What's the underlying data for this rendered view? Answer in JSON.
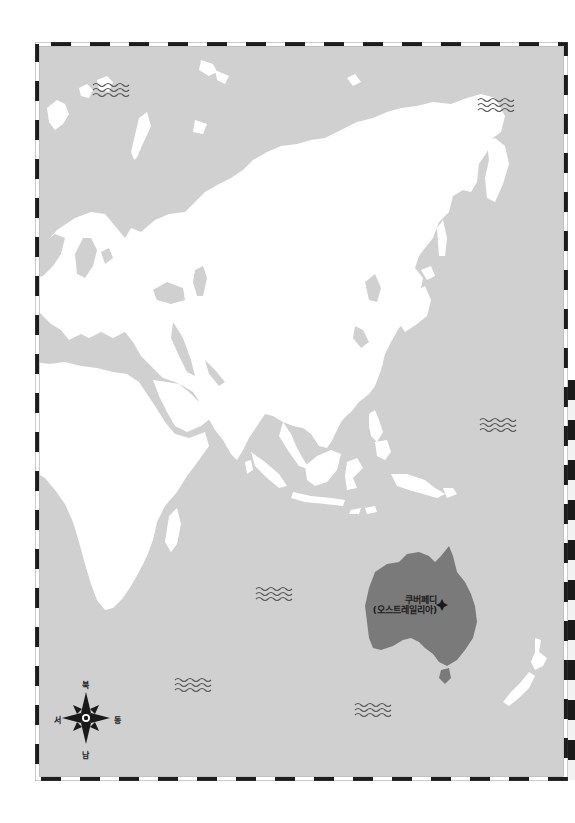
{
  "map": {
    "title": "",
    "colors": {
      "ocean": "#d0d0d0",
      "land": "#ffffff",
      "highlight_land": "#7a7a7a",
      "border_dark": "#1c1c1c",
      "border_light": "#ffffff",
      "wave": "#555555"
    },
    "location_marker": {
      "name": "쿠버페디",
      "country": "(오스트레일리아)",
      "icon": "diamond-marker-icon"
    },
    "compass": {
      "north": "북",
      "south": "남",
      "east": "동",
      "west": "서",
      "icon": "compass-rose-icon"
    },
    "wave_markers": [
      {
        "x": 92,
        "y": 83
      },
      {
        "x": 478,
        "y": 98
      },
      {
        "x": 480,
        "y": 418
      },
      {
        "x": 256,
        "y": 587
      },
      {
        "x": 175,
        "y": 678
      },
      {
        "x": 355,
        "y": 703
      }
    ],
    "highlighted_region": "Australia"
  }
}
